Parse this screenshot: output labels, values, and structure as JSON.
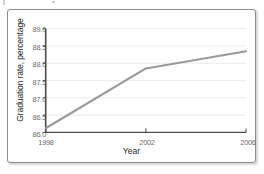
{
  "chart_data": {
    "type": "line",
    "title": "",
    "xlabel": "Year",
    "ylabel": "Graduation rate, percentage",
    "x": [
      1998,
      2002,
      2006
    ],
    "categories": [
      "1998",
      "2002",
      "2006"
    ],
    "values": [
      86.12,
      87.85,
      88.35
    ],
    "series": [
      {
        "name": "Graduation rate",
        "values": [
          86.12,
          87.85,
          88.35
        ]
      }
    ],
    "xlim": [
      1998,
      2006
    ],
    "ylim": [
      86.0,
      89.0
    ],
    "y_ticks": [
      "86.0",
      "86.5",
      "87.0",
      "87.5",
      "88.0",
      "88.5",
      "89.0"
    ],
    "y_tick_values": [
      86.0,
      86.5,
      87.0,
      87.5,
      88.0,
      88.5,
      89.0
    ],
    "x_ticks": [
      "1998",
      "2002",
      "2006"
    ],
    "x_tick_values": [
      1998,
      2002,
      2006
    ],
    "grid": true,
    "grid_axis": "y",
    "legend": false,
    "legend_position": "none",
    "line_color": "#9a9a9a",
    "axis_color": "#4a4a4a",
    "grid_color": "#ececec",
    "tick_label_color": "#6d6d6d",
    "axis_title_color": "#2a2a2a"
  }
}
